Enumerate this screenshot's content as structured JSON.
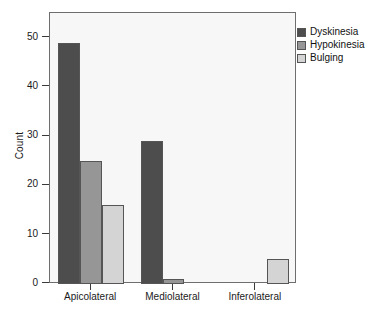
{
  "chart_data": {
    "type": "bar",
    "title": "",
    "subtitle": "",
    "xlabel": "",
    "ylabel": "Count",
    "categories": [
      "Apicolateral",
      "Mediolateral",
      "Inferolateral"
    ],
    "series": [
      {
        "name": "Dyskinesia",
        "color": "#4d4d4d",
        "values": [
          49,
          29,
          0
        ]
      },
      {
        "name": "Hypokinesia",
        "color": "#969696",
        "values": [
          25,
          1,
          0
        ]
      },
      {
        "name": "Bulging",
        "color": "#d4d4d4",
        "values": [
          16,
          0,
          5
        ]
      }
    ],
    "ylim": [
      0,
      55
    ],
    "yticks": [
      0,
      10,
      20,
      30,
      40,
      50
    ],
    "ytick_labels": [
      "0",
      "10",
      "20",
      "30",
      "40",
      "50"
    ],
    "grid": false,
    "legend_position": "right-top",
    "plot_background": "#f7f7f7",
    "frame_color": "#6e6e6e",
    "bar_edge_color": "#555555"
  }
}
